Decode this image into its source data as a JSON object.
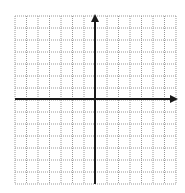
{
  "figure": {
    "type": "coordinate-plane",
    "background": "#ffffff",
    "grid": {
      "left": 15,
      "top": 16,
      "right": 176,
      "bottom": 184,
      "columns": 14,
      "rows": 14,
      "line_color": "#9a9a9a",
      "line_style": "dotted"
    },
    "axes": {
      "origin_x": 95,
      "origin_y": 99,
      "color": "#1a1a1a",
      "width": 2,
      "x_axis": {
        "start": 15,
        "end": 178,
        "arrow": "right"
      },
      "y_axis": {
        "start": 184,
        "end": 14,
        "arrow": "up"
      }
    },
    "labels": []
  }
}
